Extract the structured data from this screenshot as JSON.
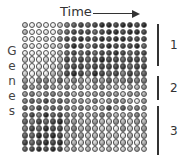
{
  "title": "Time",
  "ylabel": [
    "G",
    "e",
    "n",
    "e",
    "s"
  ],
  "clusters": [
    {
      "label": "1",
      "top": 24,
      "height": 42,
      "label_top": 38
    },
    {
      "label": "2",
      "top": 76,
      "height": 24,
      "label_top": 81
    },
    {
      "label": "3",
      "top": 106,
      "height": 49,
      "label_top": 124
    }
  ],
  "grid": {
    "rows": 19,
    "cols": 18,
    "levels": [
      [
        3,
        1,
        2,
        1,
        1,
        3,
        6,
        7,
        8,
        7,
        8,
        9,
        9,
        8,
        9,
        9,
        8,
        9
      ],
      [
        4,
        1,
        1,
        2,
        1,
        5,
        7,
        8,
        8,
        8,
        7,
        8,
        9,
        9,
        8,
        9,
        9,
        8
      ],
      [
        2,
        1,
        1,
        3,
        2,
        6,
        8,
        8,
        9,
        8,
        8,
        9,
        8,
        9,
        9,
        8,
        8,
        8
      ],
      [
        3,
        2,
        1,
        2,
        3,
        4,
        7,
        9,
        8,
        6,
        8,
        8,
        9,
        8,
        8,
        8,
        9,
        7
      ],
      [
        2,
        1,
        2,
        1,
        2,
        4,
        7,
        8,
        7,
        8,
        7,
        8,
        8,
        9,
        8,
        7,
        8,
        8
      ],
      [
        3,
        2,
        1,
        3,
        2,
        4,
        8,
        7,
        8,
        7,
        8,
        9,
        8,
        8,
        7,
        8,
        8,
        7
      ],
      [
        2,
        1,
        2,
        2,
        3,
        5,
        7,
        8,
        8,
        7,
        8,
        8,
        8,
        8,
        8,
        7,
        8,
        8
      ],
      [
        3,
        1,
        3,
        2,
        4,
        5,
        8,
        9,
        8,
        6,
        9,
        8,
        7,
        8,
        6,
        8,
        7,
        7
      ],
      [
        5,
        2,
        6,
        6,
        4,
        7,
        4,
        6,
        5,
        3,
        6,
        5,
        7,
        5,
        6,
        7,
        6,
        6
      ],
      [
        6,
        5,
        5,
        6,
        5,
        4,
        6,
        4,
        5,
        3,
        5,
        6,
        4,
        4,
        3,
        5,
        4,
        5
      ],
      [
        5,
        6,
        4,
        6,
        6,
        5,
        6,
        4,
        5,
        4,
        5,
        5,
        5,
        5,
        3,
        5,
        5,
        4
      ],
      [
        6,
        7,
        6,
        8,
        6,
        7,
        6,
        5,
        5,
        4,
        6,
        3,
        5,
        6,
        5,
        4,
        2,
        5
      ],
      [
        7,
        6,
        8,
        6,
        7,
        7,
        6,
        5,
        6,
        5,
        4,
        5,
        8,
        4,
        7,
        5,
        6,
        5
      ],
      [
        6,
        8,
        6,
        9,
        7,
        8,
        6,
        5,
        5,
        4,
        5,
        6,
        5,
        4,
        4,
        5,
        6,
        4
      ],
      [
        7,
        6,
        8,
        7,
        8,
        9,
        6,
        5,
        4,
        4,
        5,
        4,
        3,
        5,
        4,
        3,
        5,
        4
      ],
      [
        6,
        8,
        7,
        9,
        8,
        8,
        5,
        6,
        4,
        5,
        4,
        3,
        4,
        2,
        5,
        3,
        4,
        5
      ],
      [
        7,
        7,
        9,
        8,
        9,
        8,
        4,
        5,
        5,
        3,
        4,
        4,
        3,
        4,
        2,
        4,
        3,
        4
      ],
      [
        8,
        7,
        8,
        9,
        8,
        9,
        5,
        4,
        3,
        4,
        3,
        4,
        3,
        3,
        4,
        3,
        2,
        4
      ],
      [
        7,
        8,
        9,
        8,
        9,
        8,
        4,
        5,
        3,
        4,
        3,
        3,
        4,
        3,
        3,
        3,
        4,
        3
      ]
    ]
  },
  "colors": {
    "ink": "#333333",
    "background": "#ffffff"
  }
}
